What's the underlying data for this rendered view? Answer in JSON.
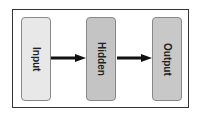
{
  "diagram": {
    "nodes": [
      {
        "label": "Input",
        "fill": "#e8e8e8"
      },
      {
        "label": "Hidden",
        "fill": "#c4c4c4"
      },
      {
        "label": "Output",
        "fill": "#c8c8c8"
      }
    ],
    "edges": [
      {
        "from": "Input",
        "to": "Hidden"
      },
      {
        "from": "Hidden",
        "to": "Output"
      }
    ]
  }
}
